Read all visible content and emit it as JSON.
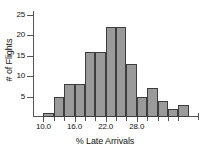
{
  "chart_data": {
    "type": "bar",
    "title": "",
    "xlabel": "% Late Arrivals",
    "ylabel": "# of Flights",
    "bin_width": 2,
    "bin_start": 10.0,
    "categories": [
      "10-12",
      "12-14",
      "14-16",
      "16-18",
      "18-20",
      "20-22",
      "22-24",
      "24-26",
      "26-28",
      "28-30",
      "30-32",
      "32-34",
      "34-36",
      "36-38"
    ],
    "bin_left_edges": [
      10.0,
      12.0,
      14.0,
      16.0,
      18.0,
      20.0,
      22.0,
      24.0,
      26.0,
      28.0,
      30.0,
      32.0,
      34.0,
      36.0
    ],
    "values": [
      1,
      5,
      8,
      8,
      16,
      16,
      22,
      22,
      13,
      5,
      7,
      4,
      2,
      3
    ],
    "ylim": [
      0,
      26
    ],
    "xlim": [
      8.0,
      40.0
    ],
    "ytick_values": [
      5,
      10,
      15,
      20,
      25
    ],
    "ytick_labels": [
      "5",
      "10",
      "15",
      "20",
      "25"
    ],
    "xtick_values": [
      10.0,
      16.0,
      22.0,
      28.0
    ],
    "xtick_labels": [
      "10.0",
      "16.0",
      "22.0",
      "28.0"
    ],
    "xtick_minor_values": [
      12.0,
      14.0,
      18.0,
      20.0,
      24.0,
      26.0,
      30.0,
      32.0,
      34.0,
      36.0
    ],
    "grid": false,
    "legend": null,
    "bar_fill_color": "#9a9a9a",
    "bar_edge_color": "#3d3d3d",
    "axis_color": "#555555",
    "text_color": "#111111",
    "background_color": "#ffffff"
  }
}
